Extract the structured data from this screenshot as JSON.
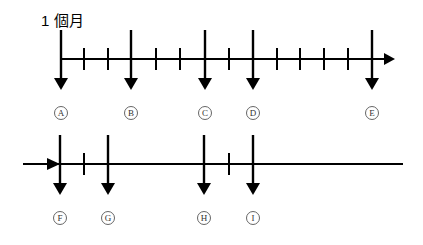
{
  "title": "1 個月",
  "colors": {
    "line": "#000000",
    "circle": "#555555",
    "background": "#ffffff"
  },
  "timelines": [
    {
      "name": "top-timeline",
      "y": 59,
      "x_start": 61,
      "x_end": 395,
      "start_arrow": false,
      "end_arrowhead": true,
      "ticks": [
        84,
        108,
        156,
        180,
        229,
        277,
        300,
        324,
        348
      ],
      "markers": [
        {
          "label": "A",
          "x": 61
        },
        {
          "label": "B",
          "x": 131
        },
        {
          "label": "C",
          "x": 205
        },
        {
          "label": "D",
          "x": 253
        },
        {
          "label": "E",
          "x": 372
        }
      ]
    },
    {
      "name": "bottom-timeline",
      "y": 164,
      "x_start": 23,
      "x_end": 403,
      "start_arrow": true,
      "end_arrowhead": false,
      "ticks": [
        84,
        229
      ],
      "markers": [
        {
          "label": "F",
          "x": 60
        },
        {
          "label": "G",
          "x": 108
        },
        {
          "label": "H",
          "x": 204
        },
        {
          "label": "I",
          "x": 253
        }
      ]
    }
  ]
}
